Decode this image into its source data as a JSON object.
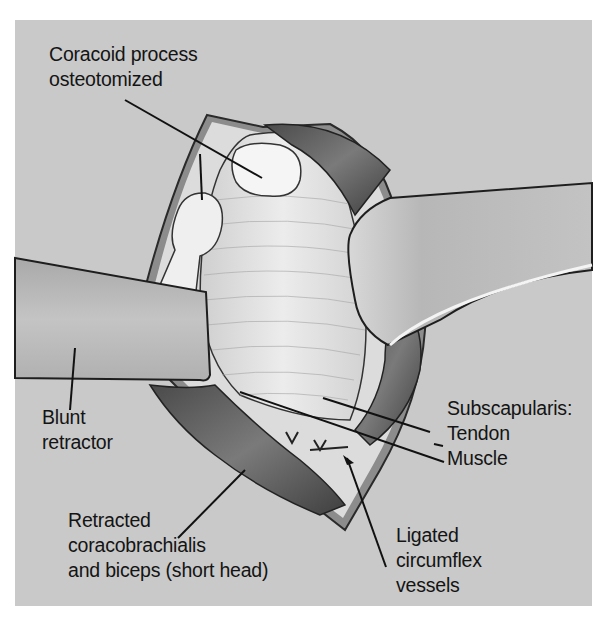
{
  "figure": {
    "colors": {
      "background": "#ffffff",
      "panel": "#c9c9c9",
      "retractor": "#b9b9b9",
      "tissue_light": "#e4e4e4",
      "muscle_dark": "#5a5a5a",
      "bone": "#f4f4f4",
      "ink": "#141414"
    }
  },
  "labels": {
    "coracoid": {
      "line1": "Coracoid process",
      "line2": "osteotomized"
    },
    "blunt_retractor": {
      "line1": "Blunt",
      "line2": "retractor"
    },
    "subscapularis": {
      "line1": "Subscapularis:",
      "line2": "Tendon",
      "line3": "Muscle"
    },
    "retracted_muscles": {
      "line1": "Retracted",
      "line2": "coracobrachialis",
      "line3": "and biceps (short head)"
    },
    "ligated_vessels": {
      "line1": "Ligated",
      "line2": "circumflex",
      "line3": "vessels"
    }
  }
}
